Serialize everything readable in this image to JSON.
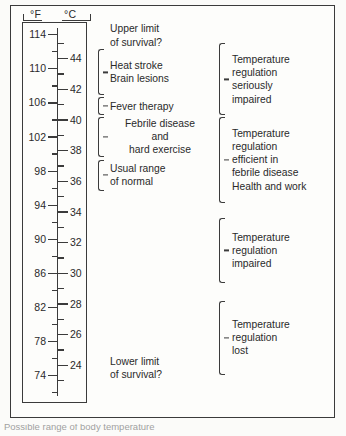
{
  "figure": {
    "units": {
      "fahrenheit": "°F",
      "celsius": "°C"
    },
    "caption_partial": "Possible range of body temperature"
  },
  "chart_data": {
    "type": "table",
    "xlabel": "",
    "ylabel": "Temperature",
    "axis": {
      "fahrenheit": {
        "label": "°F",
        "min": 72,
        "max": 116,
        "major_step": 4,
        "minor_step": 2,
        "ticks": [
          114,
          110,
          106,
          102,
          98,
          94,
          90,
          86,
          82,
          78,
          74
        ],
        "minor_ticks": [
          116,
          112,
          108,
          104,
          100,
          96,
          92,
          88,
          84,
          80,
          76,
          72
        ]
      },
      "celsius": {
        "label": "°C",
        "min": 22,
        "max": 46,
        "major_step": 2,
        "minor_step": 1,
        "ticks": [
          44,
          42,
          40,
          38,
          36,
          34,
          32,
          30,
          28,
          26,
          24
        ],
        "minor_ticks": [
          45,
          43,
          41,
          39,
          37,
          35,
          33,
          31,
          29,
          27,
          25,
          23
        ]
      }
    },
    "annotations_inner": [
      {
        "text": "Upper limit\nof survival?",
        "brace": false,
        "from_c": 46.0,
        "to_c": 45.0
      },
      {
        "text": "Heat stroke\nBrain lesions",
        "brace": true,
        "from_c": 44.6,
        "to_c": 41.6
      },
      {
        "text": "Fever therapy",
        "brace": true,
        "from_c": 41.5,
        "to_c": 40.3
      },
      {
        "text": "Febrile disease\nand\nhard exercise",
        "brace": true,
        "from_c": 40.2,
        "to_c": 37.6
      },
      {
        "text": "Usual range\nof normal",
        "brace": true,
        "from_c": 37.4,
        "to_c": 35.4
      },
      {
        "text": "Lower limit\nof survival?",
        "brace": false,
        "from_c": 24.4,
        "to_c": 23.2
      }
    ],
    "annotations_outer": [
      {
        "text": "Temperature\nregulation\nseriously\nimpaired",
        "brace": true,
        "from_c": 45.0,
        "to_c": 40.3
      },
      {
        "text": "Temperature\nregulation\nefficient in\nfebrile disease\nHealth and work",
        "brace": true,
        "from_c": 40.2,
        "to_c": 34.6
      },
      {
        "text": "Temperature\nregulation\nimpaired",
        "brace": true,
        "from_c": 33.6,
        "to_c": 29.4
      },
      {
        "text": "Temperature\nregulation\nlost",
        "brace": true,
        "from_c": 28.2,
        "to_c": 23.4
      }
    ],
    "colors": {
      "ink": "#3b3b3b",
      "text": "#2a2a2a",
      "paper": "#fdfdfb"
    }
  }
}
